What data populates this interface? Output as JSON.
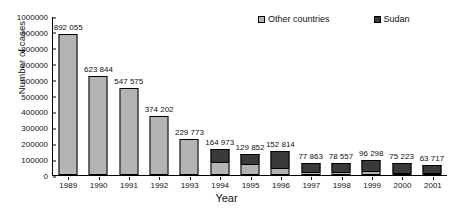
{
  "chart_data": {
    "type": "bar",
    "subtype": "stacked-column",
    "title": "",
    "xlabel": "Year",
    "ylabel": "Number of cases",
    "ylim": [
      0,
      1000000
    ],
    "ytick_step": 100000,
    "yticks": [
      "0",
      "100000",
      "200000",
      "300000",
      "400000",
      "500000",
      "600000",
      "700000",
      "800000",
      "900000",
      "1000000"
    ],
    "grid": false,
    "legend_position": "top",
    "categories": [
      "1989",
      "1990",
      "1991",
      "1992",
      "1993",
      "1994",
      "1995",
      "1996",
      "1997",
      "1998",
      "1999",
      "2000",
      "2001"
    ],
    "series": [
      {
        "name": "Other countries",
        "color": "#b4b4b4",
        "values": [
          892055,
          623844,
          547575,
          374202,
          229773,
          82000,
          72000,
          43000,
          19000,
          21000,
          25000,
          8000,
          4000
        ]
      },
      {
        "name": "Sudan",
        "color": "#3a3a3a",
        "values": [
          0,
          0,
          0,
          0,
          0,
          82973,
          57852,
          109814,
          58863,
          57557,
          71298,
          67223,
          59717
        ]
      }
    ],
    "totals": [
      892055,
      623844,
      547575,
      374202,
      229773,
      164973,
      129852,
      152814,
      77863,
      78557,
      96298,
      75223,
      63717
    ],
    "data_labels": [
      "892 055",
      "623 844",
      "547 575",
      "374 202",
      "229 773",
      "164 973",
      "129 852",
      "152 814",
      "77 863",
      "78 557",
      "96 298",
      "75 223",
      "63 717"
    ],
    "annotations": []
  },
  "legend": {
    "items": [
      {
        "label": "Other countries",
        "swatch": "other"
      },
      {
        "label": "Sudan",
        "swatch": "sudan"
      }
    ]
  }
}
